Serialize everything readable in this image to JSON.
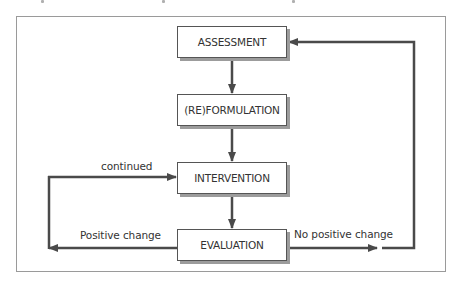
{
  "diagram": {
    "type": "flowchart",
    "nodes": {
      "assessment": "ASSESSMENT",
      "reformulation": "(RE)FORMULATION",
      "intervention": "INTERVENTION",
      "evaluation": "EVALUATION"
    },
    "edge_labels": {
      "continued": "continued",
      "positive_change": "Positive change",
      "no_positive_change": "No positive change"
    },
    "edges": [
      {
        "from": "ASSESSMENT",
        "to": "(RE)FORMULATION",
        "label": ""
      },
      {
        "from": "(RE)FORMULATION",
        "to": "INTERVENTION",
        "label": ""
      },
      {
        "from": "INTERVENTION",
        "to": "EVALUATION",
        "label": ""
      },
      {
        "from": "EVALUATION",
        "to": "INTERVENTION",
        "label": "Positive change / continued",
        "route": "left loop"
      },
      {
        "from": "EVALUATION",
        "to": "ASSESSMENT",
        "label": "No positive change",
        "route": "right loop"
      }
    ],
    "colors": {
      "line": "#4a4a4a",
      "box_border": "#555555",
      "shadow": "#9c9c9c",
      "frame": "#9a9a9a",
      "text": "#333333"
    }
  }
}
